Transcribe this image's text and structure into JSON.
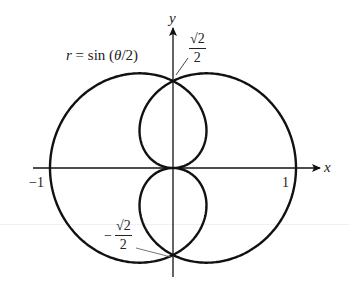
{
  "chart_data": {
    "type": "polar-curve",
    "equation": "r = sin(θ/2)",
    "theta_range": [
      0,
      12.566
    ],
    "axes": {
      "x_label": "x",
      "y_label": "y",
      "x_ticks": [
        {
          "value": -1,
          "label": "−1"
        },
        {
          "value": 1,
          "label": "1"
        }
      ]
    },
    "annotations": [
      {
        "point": [
          0,
          0.7071
        ],
        "label_num": "√2",
        "label_den": "2",
        "sign": ""
      },
      {
        "point": [
          0,
          -0.7071
        ],
        "label_num": "√2",
        "label_den": "2",
        "sign": "−"
      }
    ],
    "curve_label": "r = sin (θ/2)",
    "color": "#111111"
  },
  "labels": {
    "curve_r": "r",
    "curve_rest": " = sin (",
    "curve_theta": "θ",
    "curve_end": "/2)",
    "x_axis": "x",
    "y_axis": "y",
    "tick_neg1": "−1",
    "tick_pos1": "1",
    "top_num": "√2",
    "top_den": "2",
    "bot_sign": "−",
    "bot_num": "√2",
    "bot_den": "2"
  }
}
